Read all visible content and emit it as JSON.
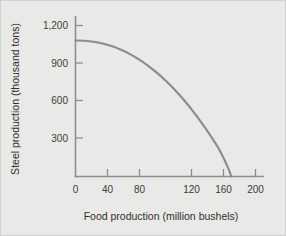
{
  "figure": {
    "background_color": "#e9e9e7",
    "border_color": "#d2d2d0",
    "curve_color": "#8b8b8b",
    "axis_color": "#8e8e8e",
    "text_color": "#2f2f2f"
  },
  "chart_data": {
    "type": "line",
    "title": "",
    "subtitle": "",
    "xlabel": "Food production (million bushels)",
    "ylabel": "Steel production (thousand tons)",
    "xlim": [
      0,
      210
    ],
    "ylim": [
      0,
      1300
    ],
    "x_ticks": [
      0,
      40,
      80,
      120,
      160,
      200
    ],
    "x_tick_labels": [
      "0",
      "40",
      "80",
      "120",
      "160",
      "200"
    ],
    "y_ticks": [
      300,
      600,
      900,
      1200
    ],
    "y_tick_labels": [
      "300",
      "600",
      "900",
      "1,200"
    ],
    "grid": false,
    "legend": false,
    "legend_position": "none",
    "annotations": [],
    "series": [
      {
        "name": "Production possibilities frontier",
        "x": [
          0,
          10,
          20,
          30,
          40,
          50,
          60,
          70,
          80,
          90,
          100,
          110,
          120,
          130,
          140,
          150,
          160,
          170,
          173
        ],
        "y": [
          1060,
          1058,
          1050,
          1036,
          1016,
          989,
          955,
          914,
          866,
          811,
          748,
          678,
          600,
          514,
          420,
          318,
          206,
          60,
          0
        ]
      }
    ]
  },
  "x_axis_label": "Food production (million bushels)",
  "y_axis_label": "Steel production (thousand tons)"
}
